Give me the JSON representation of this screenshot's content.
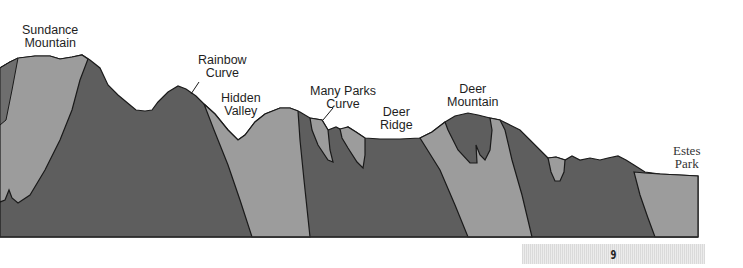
{
  "diagram": {
    "type": "geologic cross-section",
    "labels": [
      {
        "id": "sundance",
        "line1": "Sundance",
        "line2": "Mountain"
      },
      {
        "id": "rainbow",
        "line1": "Rainbow",
        "line2": "Curve"
      },
      {
        "id": "hidden",
        "line1": "Hidden",
        "line2": "Valley"
      },
      {
        "id": "manyparks",
        "line1": "Many Parks",
        "line2": "Curve"
      },
      {
        "id": "deerridge",
        "line1": "Deer",
        "line2": "Ridge"
      },
      {
        "id": "deermtn",
        "line1": "Deer",
        "line2": "Mountain"
      },
      {
        "id": "estes",
        "line1": "Estes",
        "line2": "Park"
      }
    ],
    "colors": {
      "dark_rock": "#5e5e5e",
      "light_rock": "#9c9c9c",
      "outline": "#1a1a1a"
    }
  },
  "footer": {
    "page_number": "9"
  }
}
